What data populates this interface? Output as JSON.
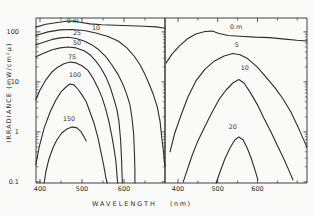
{
  "figure": {
    "background_color": "#fafaf8",
    "ink_color": "#2e2d2b",
    "y_axis_title": "IRRADIANCE (mW/cm²μ)",
    "x_axis_title": "WAVELENGTH",
    "x_axis_unit": "(nm)"
  },
  "chart_data": [
    {
      "type": "line",
      "panel": "left",
      "xlabel": "WAVELENGTH (nm)",
      "ylabel": "IRRADIANCE (mW/cm²μ)",
      "yscale": "log",
      "xlim": [
        390.5,
        697.6
      ],
      "ylim": [
        0.095,
        190
      ],
      "xticks": [
        400,
        500,
        600
      ],
      "xticks_minor": [
        450,
        550,
        650
      ],
      "yticks": [
        {
          "v": 100,
          "label": "100"
        },
        {
          "v": 10,
          "label": "10"
        },
        {
          "v": 1,
          "label": "1"
        },
        {
          "v": 0.1,
          "label": "0.1"
        }
      ],
      "series": [
        {
          "name": "depth-0m",
          "label": "0 m",
          "label_at": [
            478,
            140
          ],
          "points": [
            [
              390,
              125
            ],
            [
              414,
              143
            ],
            [
              438,
              153
            ],
            [
              462,
              163
            ],
            [
              479,
              165
            ],
            [
              495,
              156
            ],
            [
              519,
              145
            ],
            [
              548,
              139
            ],
            [
              581,
              136
            ],
            [
              614,
              133
            ],
            [
              648,
              130
            ],
            [
              676,
              126
            ],
            [
              698,
              118
            ]
          ]
        },
        {
          "name": "depth-10m",
          "label": "10",
          "label_at": [
            533,
            100
          ],
          "points": [
            [
              390,
              85
            ],
            [
              419,
              100
            ],
            [
              448,
              110
            ],
            [
              476,
              112
            ],
            [
              505,
              107
            ],
            [
              533,
              95
            ],
            [
              562,
              81
            ],
            [
              586,
              66
            ],
            [
              607,
              48
            ],
            [
              624,
              33
            ],
            [
              638,
              22
            ],
            [
              650,
              14
            ],
            [
              660,
              9.1
            ],
            [
              669,
              5.8
            ],
            [
              679,
              3.2
            ],
            [
              686,
              1.6
            ],
            [
              690,
              0.76
            ],
            [
              694,
              0.4
            ],
            [
              696,
              0.25
            ],
            [
              698,
              0.21
            ]
          ]
        },
        {
          "name": "depth-25m",
          "label": "25",
          "label_at": [
            488,
            80
          ],
          "points": [
            [
              390,
              55
            ],
            [
              410,
              63
            ],
            [
              429,
              71
            ],
            [
              448,
              76
            ],
            [
              467,
              78
            ],
            [
              486,
              74
            ],
            [
              505,
              66
            ],
            [
              524,
              55
            ],
            [
              540,
              44
            ],
            [
              557,
              32
            ],
            [
              571,
              22
            ],
            [
              586,
              14
            ],
            [
              598,
              8.7
            ],
            [
              607,
              5.5
            ],
            [
              614,
              3.5
            ],
            [
              619,
              1.9
            ],
            [
              623,
              0.87
            ],
            [
              625,
              0.35
            ],
            [
              626,
              0.17
            ],
            [
              626,
              0.095
            ]
          ]
        },
        {
          "name": "depth-50m",
          "label": "50",
          "label_at": [
            488,
            50
          ],
          "points": [
            [
              390,
              32
            ],
            [
              410,
              38
            ],
            [
              429,
              44
            ],
            [
              448,
              48
            ],
            [
              467,
              50
            ],
            [
              486,
              48
            ],
            [
              505,
              42
            ],
            [
              519,
              35
            ],
            [
              533,
              26
            ],
            [
              545,
              19
            ],
            [
              557,
              12.6
            ],
            [
              567,
              7.9
            ],
            [
              576,
              4.6
            ],
            [
              583,
              2.8
            ],
            [
              588,
              1.6
            ],
            [
              592,
              0.69
            ],
            [
              594,
              0.3
            ],
            [
              595,
              0.17
            ],
            [
              596,
              0.095
            ]
          ]
        },
        {
          "name": "depth-75m",
          "label": "75",
          "label_at": [
            476,
            26
          ],
          "points": [
            [
              390,
              4.4
            ],
            [
              400,
              6.9
            ],
            [
              414,
              11
            ],
            [
              429,
              16
            ],
            [
              443,
              20
            ],
            [
              457,
              23
            ],
            [
              471,
              25
            ],
            [
              486,
              24
            ],
            [
              500,
              21
            ],
            [
              514,
              17
            ],
            [
              526,
              12
            ],
            [
              538,
              7.6
            ],
            [
              548,
              4.8
            ],
            [
              557,
              2.8
            ],
            [
              564,
              1.6
            ],
            [
              571,
              0.83
            ],
            [
              576,
              0.48
            ],
            [
              581,
              0.25
            ],
            [
              583,
              0.14
            ],
            [
              585,
              0.095
            ]
          ]
        },
        {
          "name": "depth-100m",
          "label": "100",
          "label_at": [
            483,
            11.5
          ],
          "points": [
            [
              390,
              0.22
            ],
            [
              398,
              0.5
            ],
            [
              410,
              1.2
            ],
            [
              424,
              2.5
            ],
            [
              438,
              4.4
            ],
            [
              450,
              6.3
            ],
            [
              462,
              7.9
            ],
            [
              471,
              9.1
            ],
            [
              481,
              8.7
            ],
            [
              490,
              7.2
            ],
            [
              500,
              5.5
            ],
            [
              510,
              4.0
            ],
            [
              519,
              2.5
            ],
            [
              529,
              1.45
            ],
            [
              538,
              0.76
            ],
            [
              545,
              0.4
            ],
            [
              552,
              0.21
            ],
            [
              557,
              0.12
            ],
            [
              560,
              0.095
            ]
          ]
        },
        {
          "name": "depth-150m",
          "label": "150",
          "label_at": [
            469,
            1.5
          ],
          "points": [
            [
              410,
              0.095
            ],
            [
              414,
              0.16
            ],
            [
              421,
              0.28
            ],
            [
              431,
              0.48
            ],
            [
              440,
              0.69
            ],
            [
              452,
              0.95
            ],
            [
              464,
              1.15
            ],
            [
              476,
              1.26
            ],
            [
              488,
              1.2
            ],
            [
              498,
              1.0
            ],
            [
              505,
              0.79
            ],
            [
              510,
              0.66
            ]
          ]
        }
      ]
    },
    {
      "type": "line",
      "panel": "right",
      "xlabel": "WAVELENGTH (nm)",
      "ylabel": "IRRADIANCE (mW/cm²μ)",
      "yscale": "log",
      "xlim": [
        367.3,
        724.6
      ],
      "ylim": [
        0.095,
        190
      ],
      "xticks": [
        400,
        500,
        600
      ],
      "xticks_minor": [
        450,
        550,
        650,
        700
      ],
      "yticks": [
        {
          "v": 100,
          "label": "100"
        },
        {
          "v": 10,
          "label": "10"
        },
        {
          "v": 1,
          "label": "1"
        },
        {
          "v": 0.1,
          "label": "0.1"
        }
      ],
      "series": [
        {
          "name": "depth-0m",
          "label": "0 m",
          "label_at": [
            546,
            103
          ],
          "points": [
            [
              370,
              24
            ],
            [
              385,
              36
            ],
            [
              403,
              52
            ],
            [
              423,
              72
            ],
            [
              445,
              91
            ],
            [
              468,
              102
            ],
            [
              486,
              104
            ],
            [
              503,
              93
            ],
            [
              526,
              85
            ],
            [
              556,
              82
            ],
            [
              594,
              79
            ],
            [
              631,
              77
            ],
            [
              669,
              72
            ],
            [
              699,
              68
            ],
            [
              724,
              66
            ]
          ]
        },
        {
          "name": "depth-5m",
          "label": "5",
          "label_at": [
            548,
            46
          ],
          "points": [
            [
              380,
              0.4
            ],
            [
              392,
              0.95
            ],
            [
              408,
              2.2
            ],
            [
              425,
              5.0
            ],
            [
              445,
              10.5
            ],
            [
              468,
              18
            ],
            [
              491,
              26
            ],
            [
              516,
              33
            ],
            [
              538,
              37
            ],
            [
              556,
              35
            ],
            [
              576,
              29
            ],
            [
              599,
              20
            ],
            [
              621,
              12.6
            ],
            [
              644,
              7.6
            ],
            [
              664,
              4.6
            ],
            [
              684,
              2.5
            ],
            [
              702,
              1.26
            ],
            [
              714,
              0.76
            ],
            [
              724,
              0.5
            ]
          ]
        },
        {
          "name": "depth-10m",
          "label": "10",
          "label_at": [
            568,
            16
          ],
          "points": [
            [
              413,
              0.1
            ],
            [
              423,
              0.17
            ],
            [
              435,
              0.33
            ],
            [
              450,
              0.66
            ],
            [
              468,
              1.3
            ],
            [
              486,
              2.5
            ],
            [
              503,
              4.4
            ],
            [
              521,
              6.9
            ],
            [
              538,
              9.5
            ],
            [
              553,
              11.2
            ],
            [
              566,
              9.5
            ],
            [
              581,
              6.3
            ],
            [
              599,
              3.6
            ],
            [
              616,
              1.9
            ],
            [
              634,
              1.0
            ],
            [
              652,
              0.5
            ],
            [
              667,
              0.28
            ],
            [
              679,
              0.17
            ],
            [
              689,
              0.11
            ]
          ]
        },
        {
          "name": "depth-20m",
          "label": "20",
          "label_at": [
            538,
            1.05
          ],
          "points": [
            [
              496,
              0.095
            ],
            [
              506,
              0.16
            ],
            [
              518,
              0.29
            ],
            [
              531,
              0.48
            ],
            [
              543,
              0.69
            ],
            [
              553,
              0.79
            ],
            [
              564,
              0.69
            ],
            [
              574,
              0.48
            ],
            [
              584,
              0.3
            ],
            [
              594,
              0.17
            ],
            [
              601,
              0.11
            ]
          ]
        }
      ]
    }
  ]
}
